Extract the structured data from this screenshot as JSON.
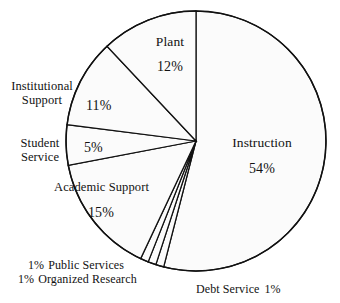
{
  "chart_data": {
    "type": "pie",
    "title": "",
    "subtitle": "",
    "xlabel": "",
    "ylabel": "",
    "legend_position": "none",
    "grid": false,
    "units": "percent",
    "start_angle_deg": 0,
    "direction": "clockwise",
    "total": 100,
    "categories": [
      "Instruction",
      "Debt Service",
      "Organized Research",
      "Public Services",
      "Academic Support",
      "Student Service",
      "Institutional Support",
      "Plant"
    ],
    "values": [
      54,
      1,
      1,
      1,
      15,
      5,
      11,
      12
    ],
    "slices": [
      {
        "label": "Instruction",
        "value": 54,
        "display": "54%",
        "start_deg": 0.0,
        "end_deg": 194.4
      },
      {
        "label": "Debt Service",
        "value": 1,
        "display": "1%",
        "start_deg": 194.4,
        "end_deg": 198.0
      },
      {
        "label": "Organized Research",
        "value": 1,
        "display": "1%",
        "start_deg": 198.0,
        "end_deg": 201.6
      },
      {
        "label": "Public Services",
        "value": 1,
        "display": "1%",
        "start_deg": 201.6,
        "end_deg": 205.2
      },
      {
        "label": "Academic Support",
        "value": 15,
        "display": "15%",
        "start_deg": 205.2,
        "end_deg": 259.2
      },
      {
        "label": "Student Service",
        "value": 5,
        "display": "5%",
        "start_deg": 259.2,
        "end_deg": 277.2
      },
      {
        "label": "Institutional Support",
        "value": 11,
        "display": "11%",
        "start_deg": 277.2,
        "end_deg": 316.8
      },
      {
        "label": "Plant",
        "value": 12,
        "display": "12%",
        "start_deg": 316.8,
        "end_deg": 360.0
      }
    ],
    "colors": {
      "slice_fill": "#fbfbfb",
      "slice_stroke": "#111111",
      "background": "#ffffff",
      "text": "#121212"
    }
  },
  "labels": {
    "plant": {
      "name": "Plant",
      "pct": "12%"
    },
    "instruction": {
      "name": "Instruction",
      "pct": "54%"
    },
    "institutional": {
      "name_line1": "Institutional",
      "name_line2": "Support",
      "pct": "11%"
    },
    "student": {
      "name_line1": "Student",
      "name_line2": "Service",
      "pct": "5%"
    },
    "academic": {
      "name": "Academic Support",
      "pct": "15%"
    },
    "public_services": {
      "pct": "1%",
      "name": "Public Services"
    },
    "organized_research": {
      "pct": "1%",
      "name": "Organized Research"
    },
    "debt_service": {
      "name": "Debt Service",
      "pct": "1%"
    }
  }
}
